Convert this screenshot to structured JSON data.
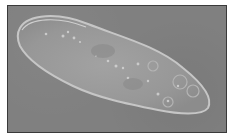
{
  "image": {
    "subject": "paramecium",
    "description": "Phase-contrast micrograph of a single-celled paramecium on a gray background",
    "colors": {
      "background": "#808080",
      "cell_body": "#9a9a9a",
      "cell_rim": "#c8c8c8",
      "border": "#3a3a3a"
    }
  }
}
